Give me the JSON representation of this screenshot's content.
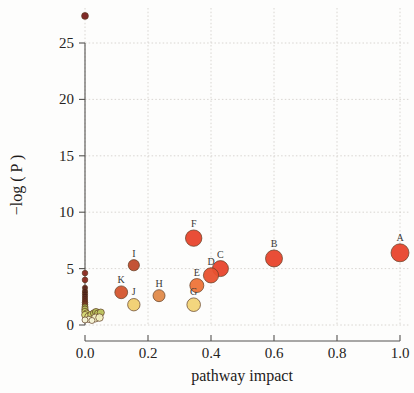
{
  "chart_data": {
    "type": "scatter",
    "title": "",
    "xlabel": "pathway impact",
    "ylabel": "−log ( P )",
    "xlim": [
      -0.03,
      1.06
    ],
    "ylim": [
      -0.6,
      28.5
    ],
    "xticks": [
      "0.0",
      "0.2",
      "0.4",
      "0.6",
      "0.8",
      "1.0"
    ],
    "xtick_values": [
      0.0,
      0.2,
      0.4,
      0.6,
      0.8,
      1.0
    ],
    "yticks": [
      "0",
      "5",
      "10",
      "15",
      "20",
      "25"
    ],
    "ytick_values": [
      0,
      5,
      10,
      15,
      20,
      25
    ],
    "grid": true,
    "legend": "none",
    "note": "Bubble size encodes pathway impact magnitude; fill color ramps from pale yellow (low) through orange to dark red (high -log P).",
    "points": [
      {
        "label": "A",
        "x": 1.0,
        "y": 6.4,
        "r": 9.0,
        "color": "#e8452c"
      },
      {
        "label": "B",
        "x": 0.6,
        "y": 5.9,
        "r": 8.5,
        "color": "#e8452c"
      },
      {
        "label": "C",
        "x": 0.43,
        "y": 5.0,
        "r": 8.0,
        "color": "#e8452c"
      },
      {
        "label": "D",
        "x": 0.4,
        "y": 4.4,
        "r": 7.6,
        "color": "#e8512f"
      },
      {
        "label": "E",
        "x": 0.355,
        "y": 3.5,
        "r": 7.0,
        "color": "#ee7439"
      },
      {
        "label": "F",
        "x": 0.345,
        "y": 7.7,
        "r": 8.2,
        "color": "#e8452c"
      },
      {
        "label": "G",
        "x": 0.345,
        "y": 1.8,
        "r": 6.8,
        "color": "#f2d477"
      },
      {
        "label": "H",
        "x": 0.235,
        "y": 2.6,
        "r": 6.0,
        "color": "#e08a4a"
      },
      {
        "label": "I",
        "x": 0.155,
        "y": 5.3,
        "r": 5.6,
        "color": "#c04a2b"
      },
      {
        "label": "J",
        "x": 0.155,
        "y": 1.8,
        "r": 6.2,
        "color": "#f0cf70"
      },
      {
        "label": "K",
        "x": 0.115,
        "y": 2.9,
        "r": 6.4,
        "color": "#d4552e"
      },
      {
        "label": "",
        "x": 0.0,
        "y": 27.4,
        "r": 3.4,
        "color": "#7a1f1c"
      },
      {
        "label": "",
        "x": 0.0,
        "y": 4.6,
        "r": 2.8,
        "color": "#8e2a20"
      },
      {
        "label": "",
        "x": 0.0,
        "y": 4.0,
        "r": 2.8,
        "color": "#8e2a20"
      },
      {
        "label": "",
        "x": 0.0,
        "y": 3.3,
        "r": 2.6,
        "color": "#5c2118"
      },
      {
        "label": "",
        "x": 0.0,
        "y": 3.0,
        "r": 2.6,
        "color": "#4f1d16"
      },
      {
        "label": "",
        "x": 0.0,
        "y": 2.8,
        "r": 2.6,
        "color": "#4a1b15"
      },
      {
        "label": "",
        "x": 0.0,
        "y": 2.6,
        "r": 2.6,
        "color": "#4a1b15"
      },
      {
        "label": "",
        "x": 0.0,
        "y": 2.4,
        "r": 2.6,
        "color": "#55201a"
      },
      {
        "label": "",
        "x": 0.0,
        "y": 2.2,
        "r": 2.6,
        "color": "#5c2118"
      },
      {
        "label": "",
        "x": 0.0,
        "y": 2.0,
        "r": 2.8,
        "color": "#6b2a1b"
      },
      {
        "label": "",
        "x": 0.0,
        "y": 1.8,
        "r": 2.8,
        "color": "#7d3b22"
      },
      {
        "label": "",
        "x": 0.0,
        "y": 1.6,
        "r": 3.0,
        "color": "#99a047"
      },
      {
        "label": "",
        "x": 0.0,
        "y": 1.4,
        "r": 3.2,
        "color": "#b6bf5a"
      },
      {
        "label": "",
        "x": 0.0,
        "y": 1.2,
        "r": 3.2,
        "color": "#c3ca63"
      },
      {
        "label": "",
        "x": 0.005,
        "y": 1.05,
        "r": 3.2,
        "color": "#cdd36c"
      },
      {
        "label": "",
        "x": 0.0,
        "y": 0.9,
        "r": 3.4,
        "color": "#d8dc78"
      },
      {
        "label": "",
        "x": 0.01,
        "y": 0.75,
        "r": 3.4,
        "color": "#e3e58a"
      },
      {
        "label": "",
        "x": 0.02,
        "y": 0.9,
        "r": 3.6,
        "color": "#c9cf68"
      },
      {
        "label": "",
        "x": 0.028,
        "y": 1.05,
        "r": 3.4,
        "color": "#bcc35e"
      },
      {
        "label": "",
        "x": 0.035,
        "y": 1.15,
        "r": 3.6,
        "color": "#b2ba58"
      },
      {
        "label": "",
        "x": 0.042,
        "y": 1.0,
        "r": 3.8,
        "color": "#c4ca64"
      },
      {
        "label": "",
        "x": 0.05,
        "y": 1.1,
        "r": 3.6,
        "color": "#bcc35e"
      },
      {
        "label": "",
        "x": 0.033,
        "y": 0.62,
        "r": 4.0,
        "color": "#f5f2c8"
      },
      {
        "label": "",
        "x": 0.046,
        "y": 0.66,
        "r": 3.8,
        "color": "#f2efc0"
      },
      {
        "label": "",
        "x": 0.012,
        "y": 0.5,
        "r": 3.2,
        "color": "#f6f4d2"
      },
      {
        "label": "",
        "x": 0.0,
        "y": 0.45,
        "r": 3.0,
        "color": "#f7f5d8"
      },
      {
        "label": "",
        "x": 0.022,
        "y": 0.4,
        "r": 3.0,
        "color": "#f7f5d8"
      }
    ]
  },
  "geometry": {
    "plot_left": 85,
    "plot_right": 400,
    "plot_bottom": 325,
    "plot_top": 43,
    "x_min": 0.0,
    "x_max": 1.0,
    "y_min": 0,
    "y_max": 25
  }
}
